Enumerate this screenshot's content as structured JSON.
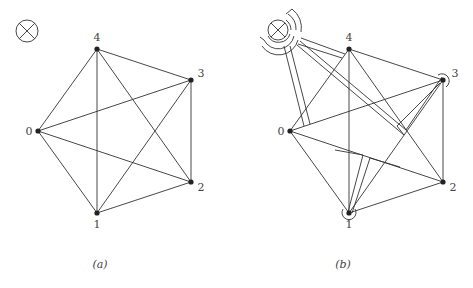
{
  "panels": [
    {
      "id": "a",
      "caption": "(a)",
      "nodes": [
        {
          "label": "0"
        },
        {
          "label": "1"
        },
        {
          "label": "2"
        },
        {
          "label": "3"
        },
        {
          "label": "4"
        }
      ],
      "edges": [
        [
          0,
          1
        ],
        [
          0,
          2
        ],
        [
          0,
          3
        ],
        [
          0,
          4
        ],
        [
          1,
          2
        ],
        [
          1,
          3
        ],
        [
          1,
          4
        ],
        [
          2,
          3
        ],
        [
          2,
          4
        ],
        [
          3,
          4
        ]
      ],
      "symbol": "circle-cross"
    },
    {
      "id": "b",
      "caption": "(b)",
      "nodes": [
        {
          "label": "0"
        },
        {
          "label": "1"
        },
        {
          "label": "2"
        },
        {
          "label": "3"
        },
        {
          "label": "4"
        }
      ],
      "edges": [
        [
          0,
          1
        ],
        [
          0,
          2
        ],
        [
          0,
          3
        ],
        [
          0,
          4
        ],
        [
          1,
          2
        ],
        [
          1,
          3
        ],
        [
          1,
          4
        ],
        [
          2,
          3
        ],
        [
          2,
          4
        ],
        [
          3,
          4
        ]
      ],
      "symbol": "circle-cross with concentric arc tubes routed to nodes"
    }
  ]
}
